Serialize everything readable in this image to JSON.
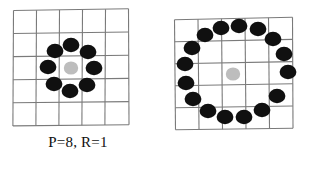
{
  "figure": {
    "background_color": "#ffffff",
    "grid_line_color": "#7a7a7a",
    "node_color": "#101010",
    "center_color": "#b9b9b9",
    "text_color": "#101010"
  },
  "panels": [
    {
      "id": "panel-left",
      "caption": "P=8, R=1",
      "points": 8,
      "radius": 1,
      "grid": {
        "rows": 5,
        "columns": 5,
        "cell_size": 23
      },
      "center": {
        "x": 71,
        "y": 68,
        "r": 6.5
      },
      "neighbors": [
        {
          "x": 94,
          "y": 68,
          "r": 7.5
        },
        {
          "x": 88,
          "y": 52,
          "r": 7.5
        },
        {
          "x": 71,
          "y": 45,
          "r": 7.5
        },
        {
          "x": 55,
          "y": 51,
          "r": 7.5
        },
        {
          "x": 48,
          "y": 67,
          "r": 7.5
        },
        {
          "x": 54,
          "y": 84,
          "r": 7.5
        },
        {
          "x": 70,
          "y": 91,
          "r": 7.5
        },
        {
          "x": 87,
          "y": 85,
          "r": 7.5
        }
      ]
    },
    {
      "id": "panel-right",
      "caption": "P=16, R=2",
      "points": 16,
      "radius": 2,
      "grid": {
        "rows": 5,
        "columns": 5,
        "cell_size": 23
      },
      "center": {
        "x": 233,
        "y": 74,
        "r": 6.5
      },
      "neighbors": [
        {
          "x": 288,
          "y": 72,
          "r": 7.5
        },
        {
          "x": 284,
          "y": 54,
          "r": 7.5
        },
        {
          "x": 273,
          "y": 39,
          "r": 7.5
        },
        {
          "x": 258,
          "y": 29,
          "r": 7.5
        },
        {
          "x": 239,
          "y": 26,
          "r": 7.5
        },
        {
          "x": 221,
          "y": 28,
          "r": 7.5
        },
        {
          "x": 205,
          "y": 35,
          "r": 7.5
        },
        {
          "x": 192,
          "y": 48,
          "r": 7.5
        },
        {
          "x": 185,
          "y": 64,
          "r": 7.5
        },
        {
          "x": 186,
          "y": 83,
          "r": 7.5
        },
        {
          "x": 193,
          "y": 99,
          "r": 7.5
        },
        {
          "x": 208,
          "y": 111,
          "r": 7.5
        },
        {
          "x": 225,
          "y": 117,
          "r": 7.5
        },
        {
          "x": 244,
          "y": 117,
          "r": 7.5
        },
        {
          "x": 262,
          "y": 110,
          "r": 7.5
        },
        {
          "x": 277,
          "y": 96,
          "r": 7.5
        }
      ]
    }
  ]
}
